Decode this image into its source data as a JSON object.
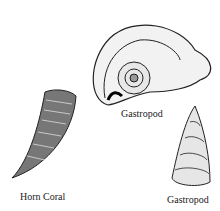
{
  "figure": {
    "items": [
      {
        "name": "horn-coral",
        "label": "Horn Coral"
      },
      {
        "name": "gastropod-coiled",
        "label": "Gastropod"
      },
      {
        "name": "gastropod-spired",
        "label": "Gastropod"
      }
    ]
  }
}
